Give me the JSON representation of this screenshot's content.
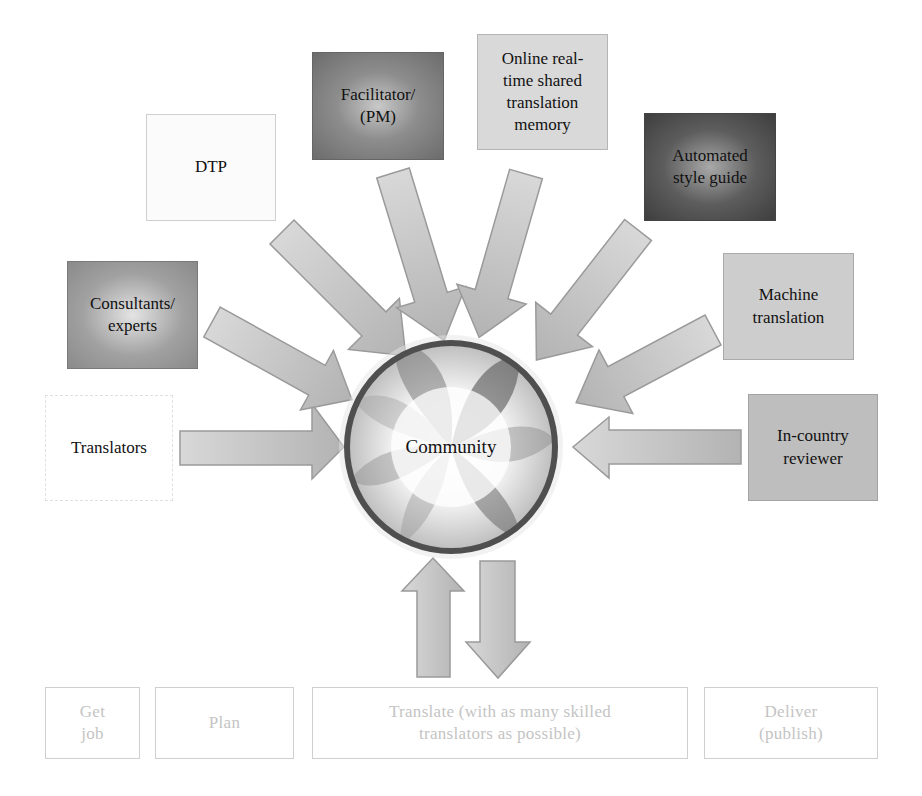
{
  "hub": {
    "label": "Community"
  },
  "contributors": [
    {
      "id": "translators",
      "label": "Translators"
    },
    {
      "id": "consultants",
      "label": "Consultants/ experts",
      "lines": [
        "Consultants/",
        "experts"
      ]
    },
    {
      "id": "dtp",
      "label": "DTP"
    },
    {
      "id": "facilitator",
      "label": "Facilitator/ (PM)",
      "lines": [
        "Facilitator/",
        "(PM)"
      ]
    },
    {
      "id": "online-tm",
      "label": "Online real-time shared translation memory",
      "lines": [
        "Online real-",
        "time shared",
        "translation",
        "memory"
      ]
    },
    {
      "id": "style-guide",
      "label": "Automated style guide",
      "lines": [
        "Automated",
        "style guide"
      ]
    },
    {
      "id": "machine-translation",
      "label": "Machine translation",
      "lines": [
        "Machine",
        "translation"
      ]
    },
    {
      "id": "reviewer",
      "label": "In-country reviewer",
      "lines": [
        "In-country",
        "reviewer"
      ]
    }
  ],
  "process_steps": [
    {
      "id": "get-job",
      "lines": [
        "Get",
        "job"
      ]
    },
    {
      "id": "plan",
      "lines": [
        "Plan"
      ]
    },
    {
      "id": "translate",
      "lines": [
        "Translate (with as many skilled",
        "translators as possible)"
      ]
    },
    {
      "id": "deliver",
      "lines": [
        "Deliver",
        "(publish)"
      ]
    }
  ],
  "colors": {
    "arrow_fill": "#bdbdbd",
    "arrow_stroke": "#9a9a9a",
    "ring": "#555555",
    "faded_text": "#c4c4c4"
  }
}
